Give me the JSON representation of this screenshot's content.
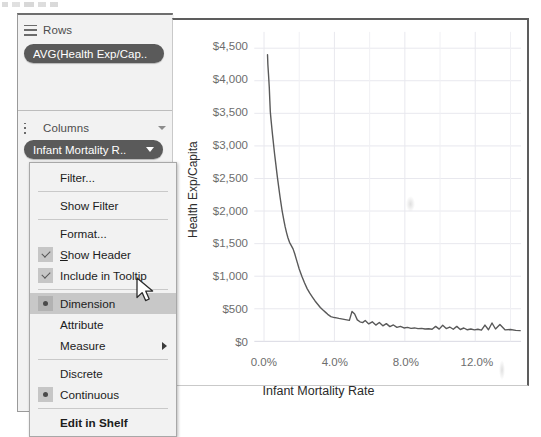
{
  "app": "tableau-shelf-and-chart",
  "shelves": {
    "rows": {
      "icon": "rows-icon",
      "label": "Rows",
      "pill": "AVG(Health Exp/Cap.."
    },
    "columns": {
      "icon": "columns-icon",
      "label": "Columns",
      "pill": "Infant Mortality R..",
      "caret": "chevron-down-icon"
    }
  },
  "context_menu": {
    "items": [
      {
        "label": "Filter...",
        "marker": "none",
        "selected": false,
        "submenu": false,
        "bold": false
      },
      {
        "separator": true
      },
      {
        "label": "Show Filter",
        "marker": "none",
        "selected": false,
        "submenu": false,
        "bold": false
      },
      {
        "separator": true
      },
      {
        "label": "Format...",
        "marker": "none",
        "selected": false,
        "submenu": false,
        "bold": false
      },
      {
        "label": "Show Header",
        "marker": "check",
        "selected": false,
        "submenu": false,
        "bold": false,
        "accel": 1
      },
      {
        "label": "Include in Tooltip",
        "marker": "check",
        "selected": false,
        "submenu": false,
        "bold": false
      },
      {
        "separator": true
      },
      {
        "label": "Dimension",
        "marker": "radio",
        "selected": true,
        "submenu": false,
        "bold": false
      },
      {
        "label": "Attribute",
        "marker": "none",
        "selected": false,
        "submenu": false,
        "bold": false
      },
      {
        "label": "Measure",
        "marker": "none",
        "selected": false,
        "submenu": true,
        "bold": false
      },
      {
        "separator": true
      },
      {
        "label": "Discrete",
        "marker": "none",
        "selected": false,
        "submenu": false,
        "bold": false
      },
      {
        "label": "Continuous",
        "marker": "radio",
        "selected": false,
        "submenu": false,
        "bold": false
      },
      {
        "separator": true
      },
      {
        "label": "Edit in Shelf",
        "marker": "none",
        "selected": false,
        "submenu": false,
        "bold": true
      }
    ],
    "highlighted_item": "Dimension"
  },
  "cursor": {
    "name": "mouse-pointer",
    "x": 136,
    "y": 277
  },
  "colors": {
    "pill_bg": "#5a5a5a",
    "pill_text": "#ffffff",
    "panel_bg": "#f2f2f2",
    "menu_bg": "#f2f2f2",
    "menu_highlight": "#c8c8c8",
    "line": "#595959",
    "grid": "#e8e8ee",
    "tick_text": "#6d6d6d"
  },
  "chart_data": {
    "type": "line",
    "title": "",
    "xlabel": "Infant Mortality Rate",
    "ylabel": "Health Exp/Capita",
    "xticks": [
      "0.0%",
      "4.0%",
      "8.0%",
      "12.0%"
    ],
    "xtick_values": [
      0,
      4,
      8,
      12
    ],
    "yticks": [
      "$0",
      "$500",
      "$1,000",
      "$1,500",
      "$2,000",
      "$2,500",
      "$3,000",
      "$3,500",
      "$4,000",
      "$4,500"
    ],
    "ytick_values": [
      0,
      500,
      1000,
      1500,
      2000,
      2500,
      3000,
      3500,
      4000,
      4500
    ],
    "xlim": [
      -0.55,
      14.6
    ],
    "ylim": [
      0,
      4750
    ],
    "grid": true,
    "legend": false,
    "series": [
      {
        "name": "AVG(Health Exp/Capita)",
        "color": "#595959",
        "x": [
          0.2,
          0.22,
          0.26,
          0.3,
          0.33,
          0.36,
          0.4,
          0.44,
          0.48,
          0.52,
          0.56,
          0.6,
          0.64,
          0.68,
          0.72,
          0.76,
          0.8,
          0.84,
          0.88,
          0.92,
          0.97,
          1.02,
          1.08,
          1.14,
          1.2,
          1.28,
          1.36,
          1.45,
          1.55,
          1.65,
          1.75,
          1.88,
          2.0,
          2.15,
          2.3,
          2.45,
          2.6,
          2.75,
          2.9,
          3.05,
          3.2,
          3.35,
          3.5,
          3.62,
          3.72,
          3.8,
          3.9,
          4.0,
          4.12,
          4.25,
          4.4,
          4.55,
          4.7,
          4.85,
          5.0,
          5.15,
          5.3,
          5.45,
          5.6,
          5.75,
          5.95,
          6.15,
          6.35,
          6.55,
          6.75,
          6.95,
          7.15,
          7.35,
          7.55,
          7.75,
          7.95,
          8.15,
          8.35,
          8.55,
          8.75,
          8.95,
          9.15,
          9.35,
          9.55,
          9.75,
          9.95,
          10.15,
          10.35,
          10.55,
          10.75,
          10.95,
          11.15,
          11.35,
          11.55,
          11.75,
          11.95,
          12.15,
          12.35,
          12.55,
          12.75,
          12.95,
          13.15,
          13.4,
          13.7,
          14.0,
          14.3,
          14.55
        ],
        "y": [
          4400,
          4250,
          4080,
          3900,
          3700,
          3520,
          3400,
          3290,
          3180,
          3080,
          2980,
          2880,
          2790,
          2700,
          2610,
          2520,
          2440,
          2360,
          2280,
          2200,
          2110,
          2020,
          1930,
          1840,
          1760,
          1670,
          1590,
          1520,
          1470,
          1420,
          1340,
          1220,
          1110,
          1000,
          900,
          810,
          740,
          680,
          620,
          570,
          520,
          480,
          445,
          415,
          395,
          380,
          372,
          366,
          360,
          352,
          345,
          338,
          330,
          322,
          460,
          420,
          330,
          300,
          288,
          320,
          268,
          300,
          250,
          290,
          238,
          272,
          226,
          252,
          214,
          230,
          206,
          214,
          200,
          206,
          196,
          200,
          190,
          194,
          186,
          230,
          188,
          246,
          196,
          220,
          186,
          230,
          182,
          205,
          178,
          190,
          176,
          186,
          172,
          250,
          178,
          282,
          190,
          260,
          176,
          182,
          168,
          164
        ],
        "style": "solid",
        "width": 1.4
      }
    ]
  }
}
